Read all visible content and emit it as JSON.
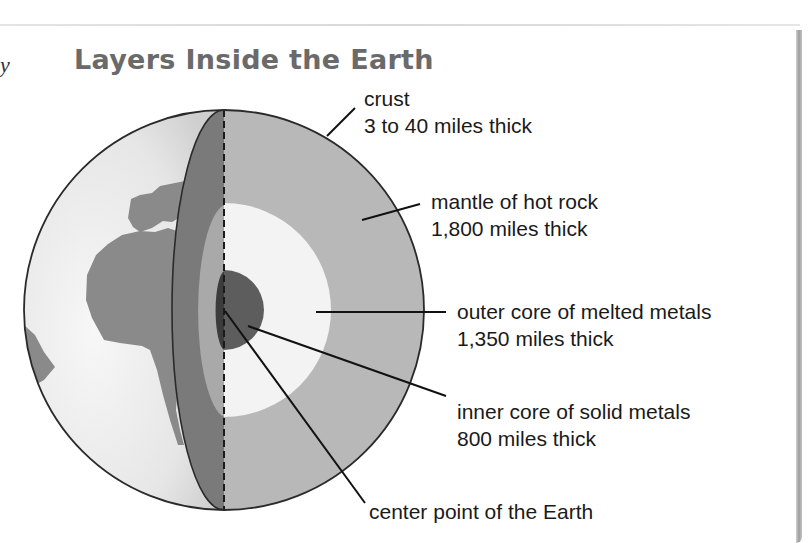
{
  "page": {
    "margin_glyph": "y",
    "title": "Layers Inside the Earth"
  },
  "diagram": {
    "layers": [
      {
        "id": "crust",
        "name": "crust",
        "thickness": "3 to 40 miles thick"
      },
      {
        "id": "mantle",
        "name": "mantle of hot rock",
        "thickness": "1,800 miles thick"
      },
      {
        "id": "outer-core",
        "name": "outer core of melted metals",
        "thickness": "1,350 miles thick"
      },
      {
        "id": "inner-core",
        "name": "inner core of solid metals",
        "thickness": "800 miles thick"
      }
    ],
    "center_label": "center point of the Earth",
    "colors": {
      "ocean": "#ececec",
      "land": "#8a8a8a",
      "mantle": "#b8b8b8",
      "cut_crust": "#7a7a7a",
      "outer_core": "#f3f3f3",
      "inner_core": "#5d5d5d",
      "outline": "#222222",
      "title": "#6a6a6a"
    }
  }
}
